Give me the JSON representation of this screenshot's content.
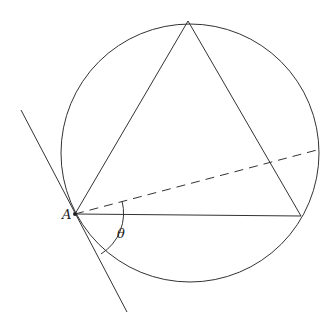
{
  "diagram": {
    "labels": {
      "point_a": "A",
      "angle": "θ"
    },
    "circle": {
      "cx": 190,
      "cy": 153,
      "r": 129
    },
    "triangle": {
      "A": [
        75,
        214
      ],
      "top": [
        188,
        21
      ],
      "right": [
        301,
        216
      ]
    },
    "tangent": {
      "from": [
        21,
        110
      ],
      "to": [
        127,
        312
      ]
    },
    "dashed_line": {
      "from": [
        75,
        214
      ],
      "to": [
        317,
        150
      ]
    },
    "colors": {
      "stroke": "#333333",
      "background": "#ffffff"
    }
  }
}
